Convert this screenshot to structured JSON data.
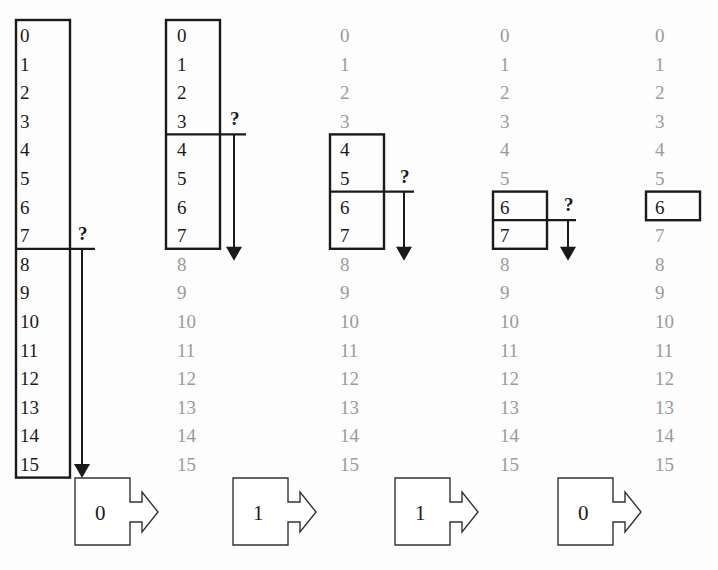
{
  "diagram": {
    "values": [
      "0",
      "1",
      "2",
      "3",
      "4",
      "5",
      "6",
      "7",
      "8",
      "9",
      "10",
      "11",
      "12",
      "13",
      "14",
      "15"
    ],
    "question_mark": "?",
    "colors": {
      "active_text": "#1a1a1a",
      "faded_text": "#9a9a9a",
      "lines": "#1a1a1a",
      "background": "#fdfdfd"
    },
    "steps": [
      {
        "column": 1,
        "active_range": [
          0,
          15
        ],
        "split_after": 7,
        "question": "?",
        "output_bit": "0"
      },
      {
        "column": 2,
        "active_range": [
          0,
          7
        ],
        "split_after": 3,
        "question": "?",
        "output_bit": "1"
      },
      {
        "column": 3,
        "active_range": [
          4,
          7
        ],
        "split_after": 5,
        "question": "?",
        "output_bit": "1"
      },
      {
        "column": 4,
        "active_range": [
          6,
          7
        ],
        "split_after": 6,
        "question": "?",
        "output_bit": "0"
      },
      {
        "column": 5,
        "active_range": [
          6,
          6
        ],
        "split_after": null,
        "question": null,
        "output_bit": null
      }
    ],
    "output_bits": [
      "0",
      "1",
      "1",
      "0"
    ],
    "result": "6"
  }
}
